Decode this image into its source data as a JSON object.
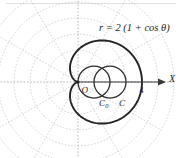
{
  "figure": {
    "background_color": "#ffffff",
    "curve_color": "#232323",
    "grid_color": "#b9b9bd",
    "axis_color": "#3a3a3a",
    "labels": {
      "equation_r": "r",
      "equation_eq": "=",
      "equation_body": "2 (1 + cos θ)",
      "equation_full": "r = 2 (1 + cos θ)",
      "origin": "O",
      "center_c0": "C",
      "center_c0_sub": "0",
      "center_c": "C",
      "x_axis": "X",
      "x_tick_4": "4"
    }
  },
  "chart_data": {
    "type": "line",
    "title": "r = 2 (1 + cos θ)",
    "coordinate_system": "polar",
    "xlabel": "X",
    "ylabel": "",
    "grid": true,
    "legend": "none",
    "annotations": [
      {
        "text": "r = 2 (1 + cos θ)",
        "x": 2.6,
        "y": 3.3
      },
      {
        "text": "O",
        "x": 0.18,
        "y": -0.42
      },
      {
        "text": "C₀",
        "x": 1.05,
        "y": -1.05
      },
      {
        "text": "C",
        "x": 2.05,
        "y": -1.05
      },
      {
        "text": "4",
        "x": 4.05,
        "y": -0.45
      },
      {
        "text": "X",
        "x": 5.15,
        "y": 0.15
      }
    ],
    "series": [
      {
        "name": "cardioid",
        "equation": "r = 2(1 + cos(theta))",
        "style": "thick-solid",
        "theta_range_deg": [
          0,
          360
        ],
        "max_r": 4,
        "cusp": [
          0,
          0
        ],
        "vertex": [
          4,
          0
        ]
      },
      {
        "name": "circle-C0",
        "equation": "r = 2 cos(theta)",
        "style": "thin-solid",
        "center": [
          1,
          0
        ],
        "radius": 1
      },
      {
        "name": "circle-C",
        "equation": "(x-2)^2 + y^2 = 1",
        "style": "thin-solid",
        "center": [
          2,
          0
        ],
        "radius": 1
      }
    ],
    "polar_grid": {
      "radial_rings": [
        0.8,
        1.6,
        2.4,
        3.2,
        4.0,
        4.8
      ],
      "angular_lines_deg": [
        0,
        30,
        60,
        90,
        120,
        150,
        180,
        210,
        240,
        270,
        300,
        330
      ],
      "ring_count": 6,
      "spoke_count": 12
    },
    "x_ticks": [
      4
    ],
    "xlim": [
      -5.2,
      5.4
    ],
    "ylim": [
      -4.4,
      4.4
    ]
  }
}
